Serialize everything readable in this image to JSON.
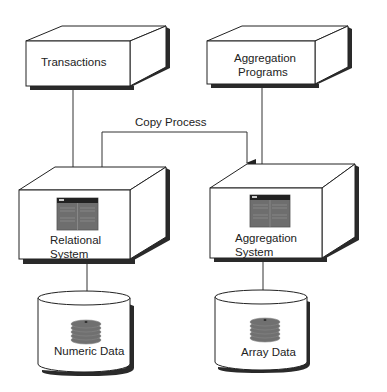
{
  "diagram": {
    "nodes": {
      "transactions": {
        "label": "Transactions"
      },
      "aggregation_programs": {
        "line1": "Aggregation",
        "line2": "Programs"
      },
      "relational_system": {
        "line1": "Relational",
        "line2": "System",
        "icon": "table-screen-icon"
      },
      "aggregation_system": {
        "line1": "Aggregation",
        "line2": "System",
        "icon": "table-screen-icon"
      },
      "numeric_data": {
        "label": "Numeric Data",
        "icon": "disk-stack-icon"
      },
      "array_data": {
        "label": "Array Data",
        "icon": "disk-stack-icon"
      }
    },
    "edges": [
      {
        "from": "transactions",
        "to": "relational_system",
        "arrow": true
      },
      {
        "from": "aggregation_programs",
        "to": "aggregation_system",
        "arrow": true
      },
      {
        "from": "relational_system",
        "to": "aggregation_system",
        "label": "Copy Process",
        "arrow": true
      },
      {
        "from": "relational_system",
        "to": "numeric_data",
        "arrow": false
      },
      {
        "from": "aggregation_system",
        "to": "array_data",
        "arrow": false
      }
    ],
    "copy_process_label": "Copy Process",
    "colors": {
      "line": "#333333",
      "shadow": "#2a2a2a",
      "screen": "#6e6e6e",
      "disk": "#707070"
    }
  }
}
